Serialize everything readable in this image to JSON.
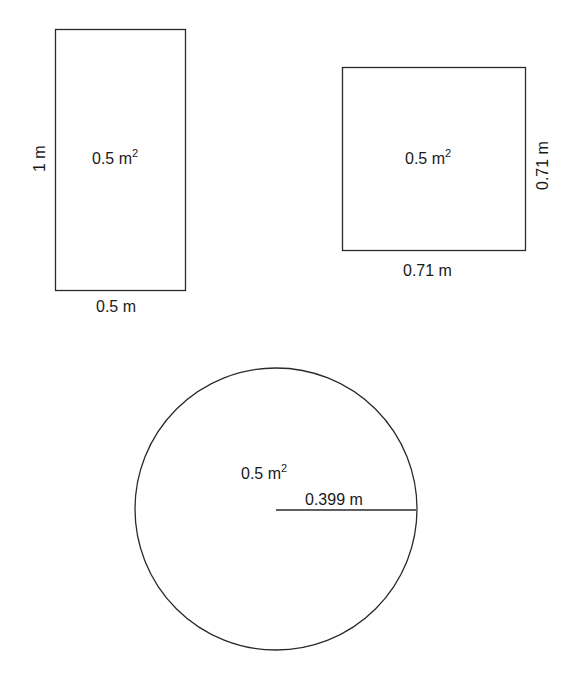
{
  "diagram": {
    "rectangle": {
      "area_label": "0.5 m",
      "area_exp": "2",
      "height_label": "1 m",
      "width_label": "0.5 m"
    },
    "square": {
      "area_label": "0.5 m",
      "area_exp": "2",
      "side_right_label": "0.71 m",
      "side_bottom_label": "0.71 m"
    },
    "circle": {
      "area_label": "0.5 m",
      "area_exp": "2",
      "radius_label": "0.399 m"
    },
    "colors": {
      "stroke": "#2a2a2a",
      "background": "#ffffff"
    }
  }
}
